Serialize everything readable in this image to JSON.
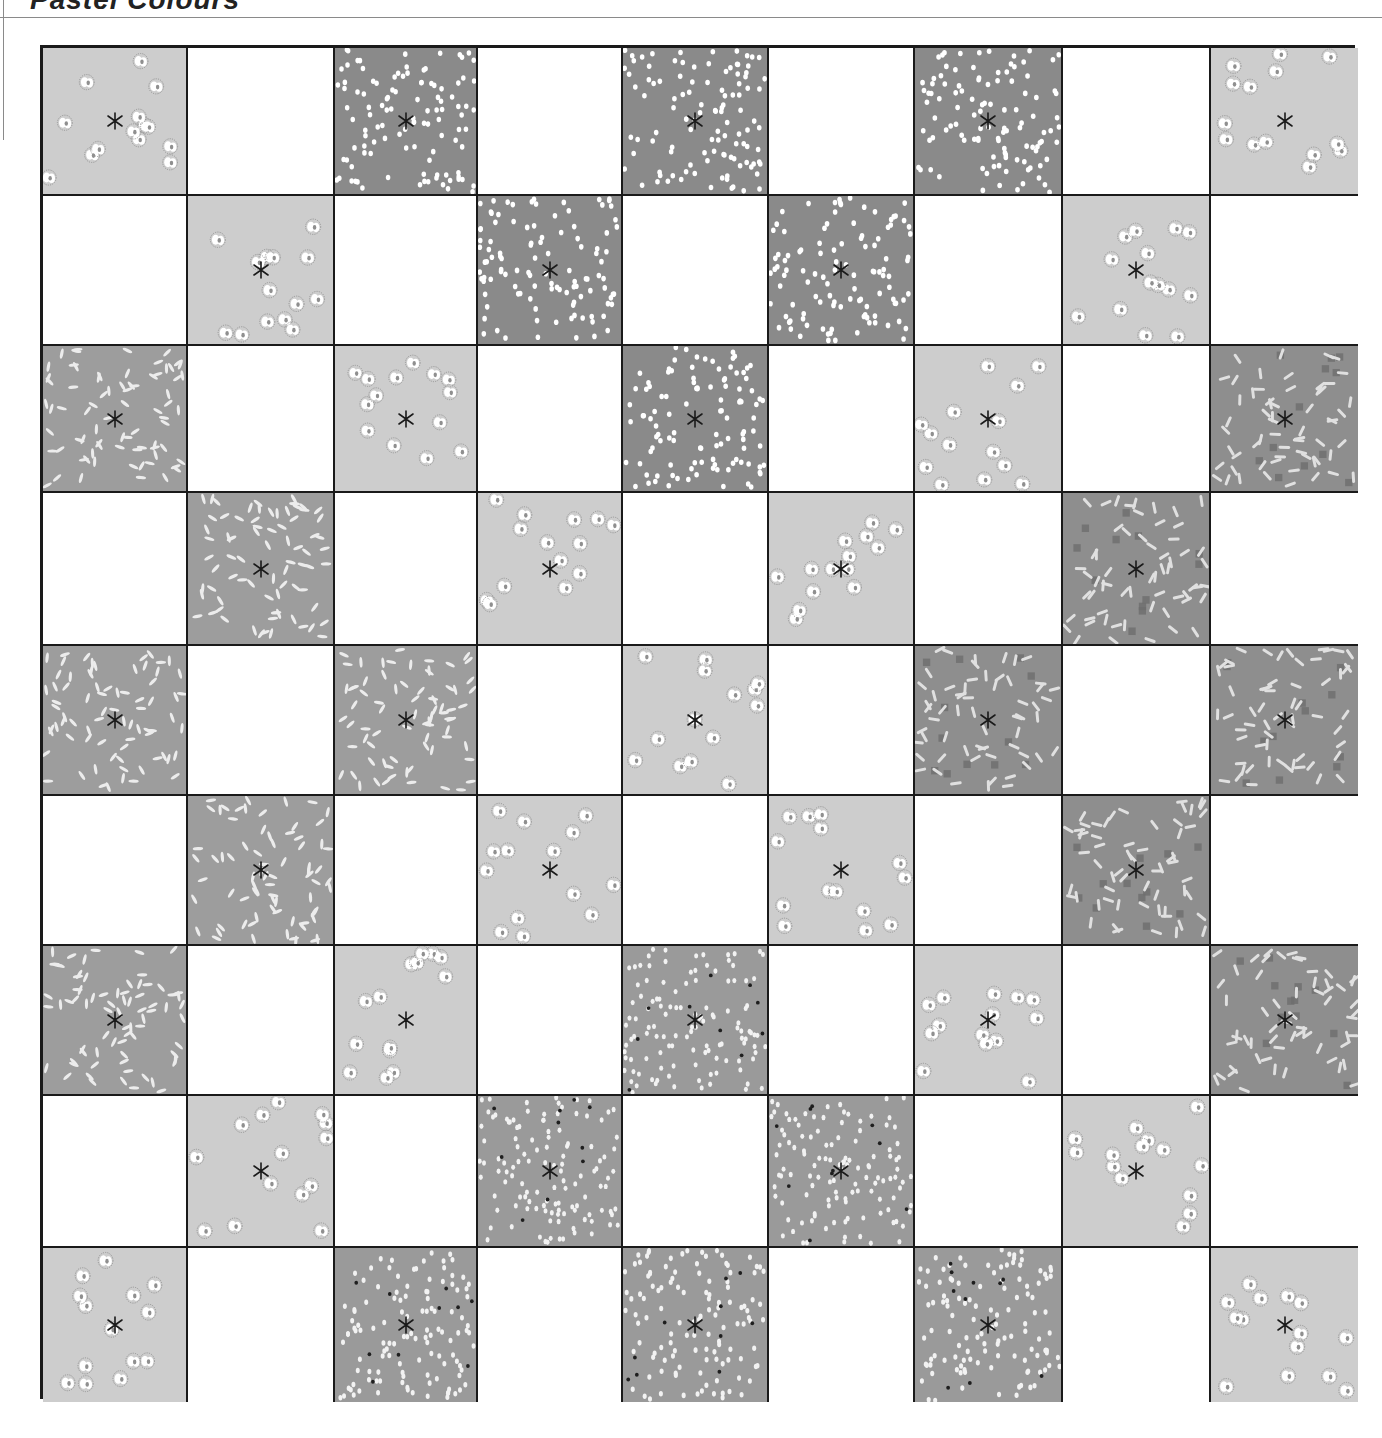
{
  "header": {
    "title": "Pastel Colours"
  },
  "board": {
    "rows": 9,
    "cols": 9,
    "legend": {
      "F": {
        "name": "light-flower-print",
        "bg": "#cdcdcd",
        "mark": "#ffffff",
        "accent": "#8f8f8f"
      },
      "D": {
        "name": "dark-fleck-print",
        "bg": "#8a8a8a",
        "mark": "#ffffff",
        "accent": "#6a6a6a"
      },
      "R": {
        "name": "rice-dash-print",
        "bg": "#9d9d9d",
        "mark": "#ececec",
        "accent": "#7d7d7d"
      },
      "C": {
        "name": "confetti-squiggle-print",
        "bg": "#8e8e8e",
        "mark": "#e0e0e0",
        "accent": "#6e6e6e"
      },
      "S": {
        "name": "speckled-dot-print",
        "bg": "#9a9a9a",
        "mark": "#f2f2f2",
        "accent": "#1e1e1e"
      },
      "_": {
        "name": "blank-white",
        "bg": "#ffffff"
      }
    },
    "cells": [
      [
        "F",
        "_",
        "D",
        "_",
        "D",
        "_",
        "D",
        "_",
        "F"
      ],
      [
        "_",
        "F",
        "_",
        "D",
        "_",
        "D",
        "_",
        "F",
        "_"
      ],
      [
        "R",
        "_",
        "F",
        "_",
        "D",
        "_",
        "F",
        "_",
        "C"
      ],
      [
        "_",
        "R",
        "_",
        "F",
        "_",
        "F",
        "_",
        "C",
        "_"
      ],
      [
        "R",
        "_",
        "R",
        "_",
        "F",
        "_",
        "C",
        "_",
        "C"
      ],
      [
        "_",
        "R",
        "_",
        "F",
        "_",
        "F",
        "_",
        "C",
        "_"
      ],
      [
        "R",
        "_",
        "F",
        "_",
        "S",
        "_",
        "F",
        "_",
        "C"
      ],
      [
        "_",
        "F",
        "_",
        "S",
        "_",
        "S",
        "_",
        "F",
        "_"
      ],
      [
        "F",
        "_",
        "S",
        "_",
        "S",
        "_",
        "S",
        "_",
        "F"
      ]
    ],
    "line_color": "#1a1a1a",
    "stitch_color": "#1a1a1a"
  }
}
